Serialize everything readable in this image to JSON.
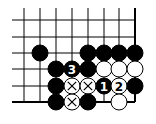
{
  "diagram": {
    "type": "go-board-fragment",
    "grid": {
      "columns_x": [
        24,
        40,
        56,
        72,
        88,
        104,
        119,
        135
      ],
      "rows_y": [
        20,
        37,
        53,
        69,
        86,
        102
      ],
      "left_extend_x": 12,
      "top_extend_y": 8,
      "right_edge_col": 7,
      "bottom_edge_row": 5,
      "line_color": "#000000",
      "stone_radius": 8
    },
    "stones": [
      {
        "color": "black",
        "col": 1,
        "row": 2,
        "label": "",
        "mark": ""
      },
      {
        "color": "black",
        "col": 4,
        "row": 2,
        "label": "",
        "mark": ""
      },
      {
        "color": "black",
        "col": 5,
        "row": 2,
        "label": "",
        "mark": ""
      },
      {
        "color": "black",
        "col": 6,
        "row": 2,
        "label": "",
        "mark": ""
      },
      {
        "color": "black",
        "col": 7,
        "row": 2,
        "label": "",
        "mark": ""
      },
      {
        "color": "black",
        "col": 2,
        "row": 3,
        "label": "",
        "mark": ""
      },
      {
        "color": "black",
        "col": 3,
        "row": 3,
        "label": "3",
        "mark": ""
      },
      {
        "color": "black",
        "col": 4,
        "row": 3,
        "label": "",
        "mark": ""
      },
      {
        "color": "white",
        "col": 5,
        "row": 3,
        "label": "",
        "mark": ""
      },
      {
        "color": "white",
        "col": 6,
        "row": 3,
        "label": "",
        "mark": ""
      },
      {
        "color": "white",
        "col": 7,
        "row": 3,
        "label": "",
        "mark": ""
      },
      {
        "color": "black",
        "col": 2,
        "row": 4,
        "label": "",
        "mark": ""
      },
      {
        "color": "white",
        "col": 3,
        "row": 4,
        "label": "",
        "mark": "x"
      },
      {
        "color": "white",
        "col": 4,
        "row": 4,
        "label": "",
        "mark": "x"
      },
      {
        "color": "black",
        "col": 5,
        "row": 4,
        "label": "1",
        "mark": ""
      },
      {
        "color": "white",
        "col": 6,
        "row": 4,
        "label": "2",
        "mark": ""
      },
      {
        "color": "black",
        "col": 7,
        "row": 4,
        "label": "",
        "mark": ""
      },
      {
        "color": "black",
        "col": 2,
        "row": 5,
        "label": "",
        "mark": ""
      },
      {
        "color": "white",
        "col": 3,
        "row": 5,
        "label": "",
        "mark": "x"
      },
      {
        "color": "black",
        "col": 4,
        "row": 5,
        "label": "",
        "mark": ""
      },
      {
        "color": "white",
        "col": 6,
        "row": 5,
        "label": "",
        "mark": ""
      }
    ],
    "move_labels": [
      "1",
      "2",
      "3"
    ]
  }
}
